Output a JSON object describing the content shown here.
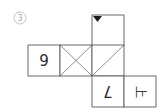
{
  "problem": {
    "label": "3",
    "label_style": "circled-number"
  },
  "net": {
    "type": "cube-net",
    "faces": [
      {
        "id": "top",
        "content": "triangle-mark",
        "description": "black downward triangle at top-left edge"
      },
      {
        "id": "left",
        "content": "9",
        "rotation": 0
      },
      {
        "id": "middle-left",
        "content": "X-cross",
        "description": "both diagonals"
      },
      {
        "id": "middle-right",
        "content": "single-diagonal",
        "description": "diagonal from top-right to bottom-left"
      },
      {
        "id": "bottom-left",
        "content": "7",
        "rotation": 180
      },
      {
        "id": "bottom-right",
        "content": "上",
        "rotation": 90
      }
    ]
  },
  "colors": {
    "line": "#5a5a5a",
    "mark": "#1a1a1a",
    "label": "#a8a8a8",
    "background": "#ffffff"
  }
}
